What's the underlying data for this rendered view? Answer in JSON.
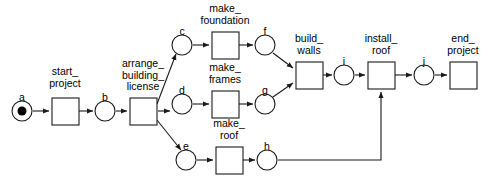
{
  "diagram": {
    "stroke_color": "#1a1a1a",
    "fill_color": "#ffffff",
    "token_color": "#000000"
  },
  "places": [
    {
      "id": "a",
      "label": "a",
      "cx": 22,
      "cy": 111,
      "r": 10,
      "tokens": 1,
      "label_x": 22,
      "label_y": 92
    },
    {
      "id": "b",
      "label": "b",
      "cx": 105,
      "cy": 111,
      "r": 10,
      "tokens": 0,
      "label_x": 105,
      "label_y": 92
    },
    {
      "id": "c",
      "label": "c",
      "cx": 182,
      "cy": 45,
      "r": 10,
      "tokens": 0,
      "label_x": 182,
      "label_y": 26
    },
    {
      "id": "d",
      "label": "d",
      "cx": 182,
      "cy": 104,
      "r": 10,
      "tokens": 0,
      "label_x": 182,
      "label_y": 85
    },
    {
      "id": "e",
      "label": "e",
      "cx": 186,
      "cy": 160,
      "r": 10,
      "tokens": 0,
      "label_x": 186,
      "label_y": 141
    },
    {
      "id": "f",
      "label": "f",
      "cx": 265,
      "cy": 45,
      "r": 10,
      "tokens": 0,
      "label_x": 265,
      "label_y": 26
    },
    {
      "id": "g",
      "label": "g",
      "cx": 265,
      "cy": 104,
      "r": 10,
      "tokens": 0,
      "label_x": 265,
      "label_y": 85
    },
    {
      "id": "h",
      "label": "h",
      "cx": 267,
      "cy": 160,
      "r": 10,
      "tokens": 0,
      "label_x": 267,
      "label_y": 141
    },
    {
      "id": "i",
      "label": "i",
      "cx": 344,
      "cy": 75,
      "r": 10,
      "tokens": 0,
      "label_x": 344,
      "label_y": 56
    },
    {
      "id": "j",
      "label": "j",
      "cx": 424,
      "cy": 75,
      "r": 10,
      "tokens": 0,
      "label_x": 424,
      "label_y": 56
    }
  ],
  "transitions": [
    {
      "id": "start_project",
      "label": "start_\nproject",
      "x": 52,
      "y": 98,
      "w": 27,
      "h": 27,
      "label_x": 65,
      "label_y": 66
    },
    {
      "id": "arrange_building_license",
      "label": "arrange_\nbuilding_\nlicense",
      "x": 130,
      "y": 98,
      "w": 27,
      "h": 27,
      "label_x": 143,
      "label_y": 58
    },
    {
      "id": "make_foundation",
      "label": "make_\nfoundation",
      "x": 212,
      "y": 32,
      "w": 27,
      "h": 27,
      "label_x": 225,
      "label_y": 3
    },
    {
      "id": "make_frames",
      "label": "make_\nframes",
      "x": 212,
      "y": 91,
      "w": 27,
      "h": 27,
      "label_x": 225,
      "label_y": 62
    },
    {
      "id": "make_roof",
      "label": "make_\nroof",
      "x": 216,
      "y": 147,
      "w": 27,
      "h": 27,
      "label_x": 229,
      "label_y": 118
    },
    {
      "id": "build_walls",
      "label": "build_\nwalls",
      "x": 296,
      "y": 62,
      "w": 27,
      "h": 27,
      "label_x": 309,
      "label_y": 33
    },
    {
      "id": "install_roof",
      "label": "install_\nroof",
      "x": 368,
      "y": 62,
      "w": 27,
      "h": 27,
      "label_x": 381,
      "label_y": 33
    },
    {
      "id": "end_project",
      "label": "end_\nproject",
      "x": 450,
      "y": 62,
      "w": 27,
      "h": 27,
      "label_x": 463,
      "label_y": 33
    }
  ],
  "arcs": [
    {
      "from": "a",
      "to": "start_project",
      "path": "M 33,111 L 49,111"
    },
    {
      "from": "start_project",
      "to": "b",
      "path": "M 79,111 L 93,111"
    },
    {
      "from": "b",
      "to": "arrange_building_license",
      "path": "M 116,111 L 127,111"
    },
    {
      "from": "arrange_building_license",
      "to": "c",
      "path": "M 157,104 L 176,54"
    },
    {
      "from": "arrange_building_license",
      "to": "d",
      "path": "M 158,111 L 170,111"
    },
    {
      "from": "arrange_building_license",
      "to": "e",
      "path": "M 157,120 L 181,150"
    },
    {
      "from": "c",
      "to": "make_foundation",
      "path": "M 193,45 L 209,45"
    },
    {
      "from": "make_foundation",
      "to": "f",
      "path": "M 239,45 L 253,45"
    },
    {
      "from": "d",
      "to": "make_frames",
      "path": "M 193,104 L 209,104"
    },
    {
      "from": "make_frames",
      "to": "g",
      "path": "M 239,104 L 253,104"
    },
    {
      "from": "e",
      "to": "make_roof",
      "path": "M 197,160 L 213,160"
    },
    {
      "from": "make_roof",
      "to": "h",
      "path": "M 243,160 L 255,160"
    },
    {
      "from": "f",
      "to": "build_walls",
      "path": "M 273,53 L 293,68"
    },
    {
      "from": "g",
      "to": "build_walls",
      "path": "M 273,97 L 293,83"
    },
    {
      "from": "build_walls",
      "to": "i",
      "path": "M 323,75 L 332,75"
    },
    {
      "from": "i",
      "to": "install_roof",
      "path": "M 355,75 L 365,75"
    },
    {
      "from": "install_roof",
      "to": "j",
      "path": "M 395,75 L 412,75"
    },
    {
      "from": "j",
      "to": "end_project",
      "path": "M 435,75 L 447,75"
    },
    {
      "from": "h",
      "to": "install_roof",
      "path": "M 278,160 L 381,160 L 381,92"
    }
  ]
}
